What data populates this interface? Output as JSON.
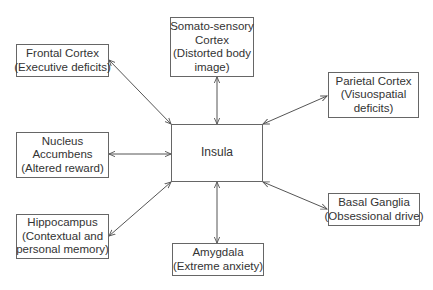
{
  "diagram": {
    "center": {
      "label": "Insula"
    },
    "nodes": {
      "frontal": {
        "lines": [
          "Frontal Cortex",
          "(Executive deficits)"
        ]
      },
      "somato": {
        "lines": [
          "Somato-sensory",
          "Cortex",
          "(Distorted body",
          "image)"
        ]
      },
      "parietal": {
        "lines": [
          "Parietal Cortex",
          "(Visuospatial",
          "deficits)"
        ]
      },
      "nucleus": {
        "lines": [
          "Nucleus",
          "Accumbens",
          "(Altered reward)"
        ]
      },
      "basal": {
        "lines": [
          "Basal Ganglia",
          "(Obsessional drive)"
        ]
      },
      "hippocampus": {
        "lines": [
          "Hippocampus",
          "(Contextual and",
          "personal memory)"
        ]
      },
      "amygdala": {
        "lines": [
          "Amygdala",
          "(Extreme anxiety)"
        ]
      }
    },
    "edges": [
      {
        "from": "Insula",
        "to": "Frontal Cortex",
        "type": "bidirectional"
      },
      {
        "from": "Insula",
        "to": "Somato-sensory Cortex",
        "type": "bidirectional"
      },
      {
        "from": "Insula",
        "to": "Parietal Cortex",
        "type": "bidirectional"
      },
      {
        "from": "Insula",
        "to": "Nucleus Accumbens",
        "type": "bidirectional"
      },
      {
        "from": "Insula",
        "to": "Basal Ganglia",
        "type": "bidirectional"
      },
      {
        "from": "Insula",
        "to": "Hippocampus",
        "type": "bidirectional"
      },
      {
        "from": "Insula",
        "to": "Amygdala",
        "type": "bidirectional"
      }
    ],
    "colors": {
      "line": "#555555",
      "border": "#666666",
      "text": "#333333"
    }
  }
}
